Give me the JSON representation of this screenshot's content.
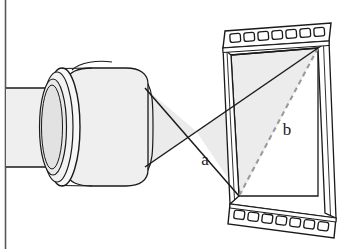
{
  "figure": {
    "background_color": "#ffffff"
  },
  "page": {
    "left_margin_rule": "vertical-rule",
    "rule_color": "#555555"
  },
  "labels": [
    {
      "id": "a",
      "text": "a",
      "meaning": "frame-height-dimension",
      "x": 205,
      "y": 165
    },
    {
      "id": "b",
      "text": "b",
      "meaning": "frame-diagonal-dimension",
      "x": 287,
      "y": 135
    }
  ],
  "components": {
    "lens": {
      "name": "camera-lens-barrel",
      "body_fill": "#efefef",
      "ring_fill": "#f7f7f7",
      "glass_fill": "#e4e4e4",
      "outline_color": "#1a1a1a"
    },
    "light_cone": {
      "name": "projected-light-cone",
      "fill": "#ebebeb",
      "ray_color": "#1a1a1a",
      "crossing_point": {
        "x": 196,
        "y": 131
      }
    },
    "film_frame": {
      "name": "film-frame-with-perforations",
      "fill": "#ffffff",
      "outline_color": "#1a1a1a",
      "perforation_count_top": 7,
      "perforation_count_bottom": 7,
      "perforation_fill": "#ffffff"
    },
    "diagonal": {
      "name": "frame-diagonal-dashed-line",
      "color": "#9a9a9a",
      "style": "dashed"
    }
  }
}
